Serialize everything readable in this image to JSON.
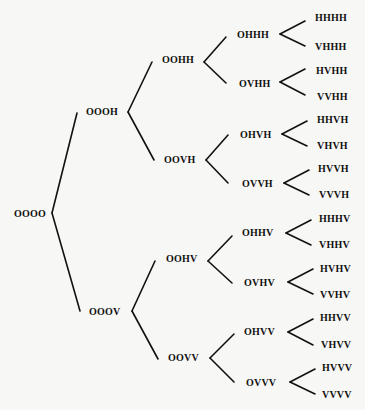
{
  "diagram": {
    "type": "binary-tree",
    "orientation": "left-to-right",
    "levels": 5,
    "nodes": {
      "root": "OOOO",
      "l1_0": "OOOH",
      "l1_1": "OOOV",
      "l2_0": "OOHH",
      "l2_1": "OOVH",
      "l2_2": "OOHV",
      "l2_3": "OOVV",
      "l3_0": "OHHH",
      "l3_1": "OVHH",
      "l3_2": "OHVH",
      "l3_3": "OVVH",
      "l3_4": "OHHV",
      "l3_5": "OVHV",
      "l3_6": "OHVV",
      "l3_7": "OVVV",
      "l4_0": "HHHH",
      "l4_1": "VHHH",
      "l4_2": "HVHH",
      "l4_3": "VVHH",
      "l4_4": "HHVH",
      "l4_5": "VHVH",
      "l4_6": "HVVH",
      "l4_7": "VVVH",
      "l4_8": "HHHV",
      "l4_9": "VHHV",
      "l4_10": "HVHV",
      "l4_11": "VVHV",
      "l4_12": "HHVV",
      "l4_13": "VHVV",
      "l4_14": "HVVV",
      "l4_15": "VVVV"
    },
    "edges": [
      [
        "OOOO",
        "OOOH"
      ],
      [
        "OOOO",
        "OOOV"
      ],
      [
        "OOOH",
        "OOHH"
      ],
      [
        "OOOH",
        "OOVH"
      ],
      [
        "OOOV",
        "OOHV"
      ],
      [
        "OOOV",
        "OOVV"
      ],
      [
        "OOHH",
        "OHHH"
      ],
      [
        "OOHH",
        "OVHH"
      ],
      [
        "OOVH",
        "OHVH"
      ],
      [
        "OOVH",
        "OVVH"
      ],
      [
        "OOHV",
        "OHHV"
      ],
      [
        "OOHV",
        "OVHV"
      ],
      [
        "OOVV",
        "OHVV"
      ],
      [
        "OOVV",
        "OVVV"
      ],
      [
        "OHHH",
        "HHHH"
      ],
      [
        "OHHH",
        "VHHH"
      ],
      [
        "OVHH",
        "HVHH"
      ],
      [
        "OVHH",
        "VVHH"
      ],
      [
        "OHVH",
        "HHVH"
      ],
      [
        "OHVH",
        "VHVH"
      ],
      [
        "OVVH",
        "HVVH"
      ],
      [
        "OVVH",
        "VVVH"
      ],
      [
        "OHHV",
        "HHHV"
      ],
      [
        "OHHV",
        "VHHV"
      ],
      [
        "OVHV",
        "HVHV"
      ],
      [
        "OVHV",
        "VVHV"
      ],
      [
        "OHVV",
        "HHVV"
      ],
      [
        "OHVV",
        "VHVV"
      ],
      [
        "OVVV",
        "HVVV"
      ],
      [
        "OVVV",
        "VVVV"
      ]
    ]
  }
}
